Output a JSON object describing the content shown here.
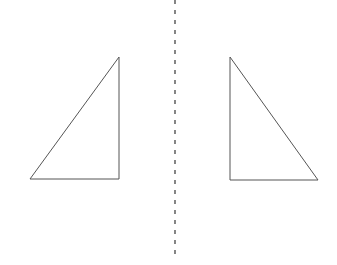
{
  "diagram": {
    "type": "reflection",
    "background": "#ffffff",
    "stroke_color": "#555555",
    "axis_color": "#444444",
    "mirror_line": {
      "x": 175,
      "y1": 0,
      "y2": 256,
      "dash": "4 6"
    },
    "shapes": [
      {
        "name": "left-triangle",
        "points": "30,179 119,179 119,57"
      },
      {
        "name": "right-triangle",
        "points": "230,57 230,180 318,180"
      }
    ]
  }
}
